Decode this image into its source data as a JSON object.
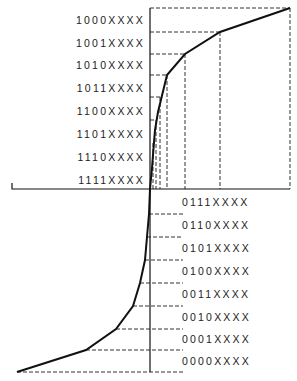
{
  "diagram": {
    "title": "",
    "upper_labels": [
      "1000XXXX",
      "1001XXXX",
      "1010XXXX",
      "1011XXXX",
      "1100XXXX",
      "1101XXXX",
      "1110XXXX",
      "1111XXXX"
    ],
    "lower_labels": [
      "0111XXXX",
      "0110XXXX",
      "0101XXXX",
      "0100XXXX",
      "0011XXXX",
      "0010XXXX",
      "0001XXXX",
      "0000XXXX"
    ],
    "upper_curve_points": [
      [
        150,
        189
      ],
      [
        152,
        168
      ],
      [
        153,
        155
      ],
      [
        155,
        130
      ],
      [
        158,
        112
      ],
      [
        167,
        75
      ],
      [
        185,
        54
      ],
      [
        220,
        32
      ],
      [
        290,
        8
      ]
    ],
    "lower_curve_points": [
      [
        150,
        189
      ],
      [
        149,
        210
      ],
      [
        147,
        237
      ],
      [
        145,
        260
      ],
      [
        140,
        283
      ],
      [
        133,
        306
      ],
      [
        116,
        329
      ],
      [
        86,
        350
      ],
      [
        17,
        372
      ]
    ],
    "line_color": "#111111",
    "dash_color": "#333333"
  }
}
